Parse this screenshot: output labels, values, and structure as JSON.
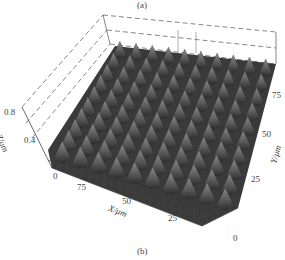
{
  "figure": {
    "top_caption": "(a)",
    "bottom_caption": "(b)"
  },
  "chart_data": {
    "type": "surface3d",
    "title": "",
    "xlabel": "X/μm",
    "ylabel": "Y/μm",
    "zlabel": "Z/μm",
    "x_ticks": [
      "0",
      "75",
      "50",
      "25"
    ],
    "y_ticks": [
      "0",
      "25",
      "50",
      "75"
    ],
    "z_ticks": [
      "0.4",
      "0.8"
    ],
    "x_range": [
      0,
      100
    ],
    "y_range": [
      0,
      100
    ],
    "z_range": [
      0,
      1.0
    ],
    "grid_peaks": [
      10,
      10
    ],
    "peak_height_approx": 0.6,
    "colormap": "grayscale",
    "box": "dashed"
  },
  "axes": {
    "z_title": "Z/μm",
    "x_title": "X/μm",
    "y_title": "Y/μm",
    "z_tick_04": "0.4",
    "z_tick_08": "0.8",
    "x_tick_0": "0",
    "x_tick_75": "75",
    "x_tick_50": "50",
    "x_tick_25": "25",
    "y_tick_0": "0",
    "y_tick_25": "25",
    "y_tick_50": "50",
    "y_tick_75": "75"
  }
}
